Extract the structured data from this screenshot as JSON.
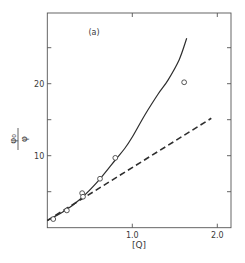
{
  "chart_data": {
    "type": "line",
    "title": "",
    "panel_label": "(a)",
    "xlabel": "[Q]",
    "ylabel": "φ₀/φ",
    "ylabel_num": "φ₀",
    "ylabel_den": "φ",
    "xlim": [
      0,
      2.16
    ],
    "ylim": [
      0,
      29.8
    ],
    "x_ticks": [
      1.0,
      2.0
    ],
    "x_tick_labels": [
      "1.0",
      "2.0"
    ],
    "y_ticks": [
      5,
      10,
      15,
      20,
      25
    ],
    "y_tick_labels": [
      "",
      "10",
      "",
      "20",
      ""
    ],
    "grid": false,
    "legend": null,
    "series": [
      {
        "name": "experimental data",
        "style": "markers (open circles)",
        "x": [
          0.07,
          0.23,
          0.41,
          0.42,
          0.62,
          0.8,
          1.61
        ],
        "y": [
          1.2,
          2.4,
          4.8,
          4.3,
          6.8,
          9.7,
          20.2
        ]
      },
      {
        "name": "fitted curve",
        "style": "solid line",
        "x": [
          0.0,
          0.2,
          0.4,
          0.6,
          0.8,
          0.91,
          1.0,
          1.15,
          1.3,
          1.42,
          1.55,
          1.64
        ],
        "y": [
          1.0,
          2.3,
          4.1,
          6.5,
          9.4,
          11.0,
          12.6,
          15.7,
          18.5,
          20.5,
          23.3,
          26.3
        ]
      },
      {
        "name": "linear (dashed)",
        "style": "dashed line",
        "x": [
          0.0,
          1.93
        ],
        "y": [
          1.0,
          15.2
        ]
      }
    ]
  },
  "plot_box": {
    "left": 47.3,
    "right": 231,
    "top": 13,
    "bottom": 227.7,
    "px_per_x": 85,
    "px_per_y": 7.2
  }
}
